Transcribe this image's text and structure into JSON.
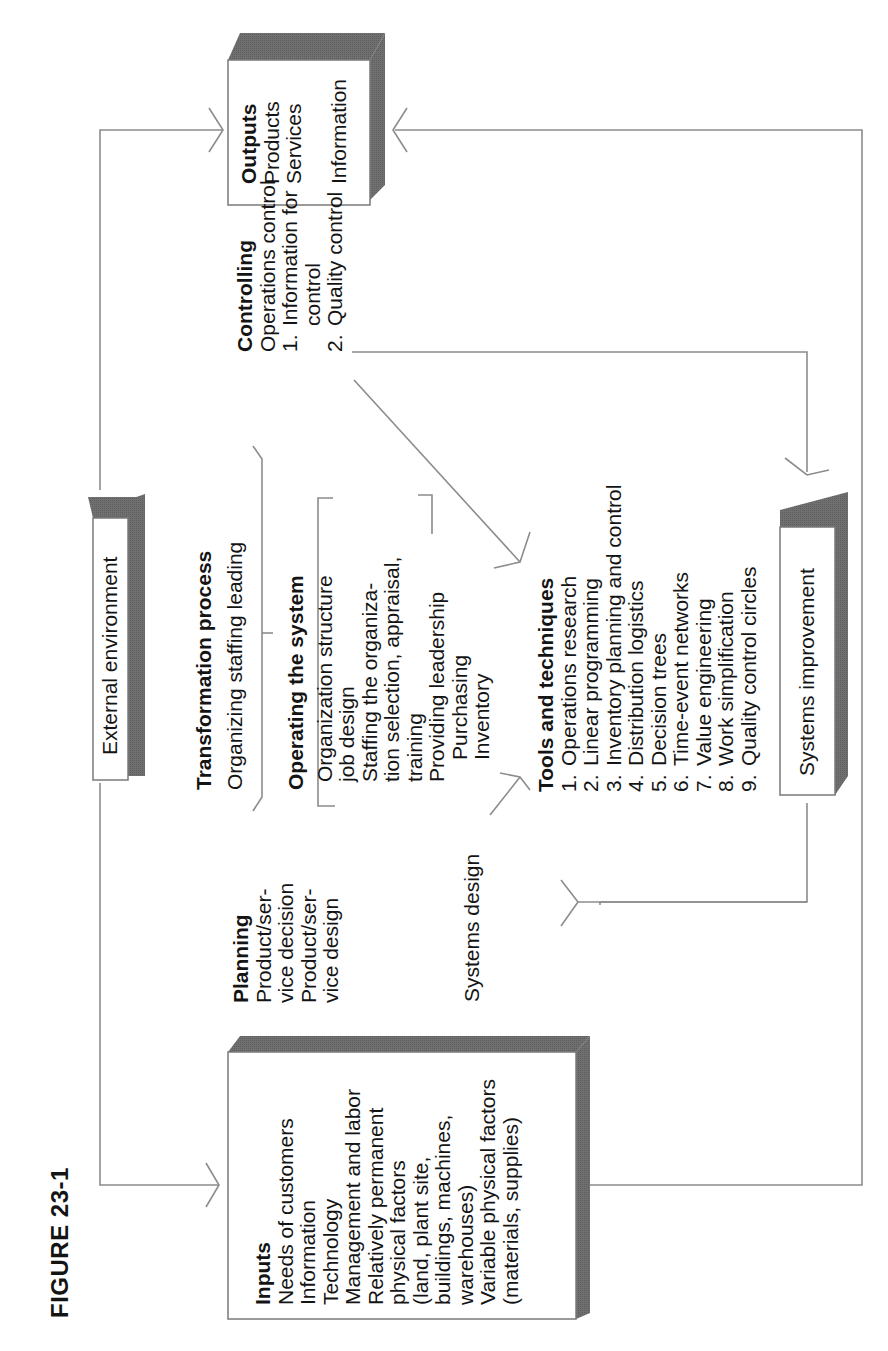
{
  "figure": {
    "label": "FIGURE 23-1"
  },
  "inputs": {
    "heading": "Inputs",
    "lines": [
      "Needs of customers",
      "Information",
      "Technology",
      "Management and labor",
      "Relatively permanent",
      "physical factors",
      "(land, plant site,",
      "buildings, machines,",
      "warehouses)",
      "Variable physical factors",
      "(materials, supplies)"
    ]
  },
  "outputs": {
    "heading": "Outputs",
    "lines": [
      "Products",
      "Services",
      "",
      "Information"
    ]
  },
  "external_environment": {
    "label": "External environment"
  },
  "systems_improvement": {
    "label": "Systems improvement"
  },
  "systems_design": {
    "label": "Systems design"
  },
  "planning": {
    "heading": "Planning",
    "lines": [
      "Product/ser-",
      "vice decision",
      "Product/ser-",
      "vice design"
    ]
  },
  "transformation": {
    "heading": "Transformation process",
    "subtitle": "Organizing staffing leading"
  },
  "operating": {
    "heading": "Operating the system",
    "lines": [
      "Organization structure",
      "job design",
      "Staffing the organiza-",
      "tion selection, appraisal,",
      "training",
      "Providing leadership",
      "Purchasing",
      "Inventory"
    ]
  },
  "controlling": {
    "heading": "Controlling",
    "lines": [
      {
        "num": "",
        "text": "Operations control",
        "indent": false
      },
      {
        "num": "1.",
        "text": "Information for",
        "indent": false
      },
      {
        "num": "",
        "text": "control",
        "indent": true
      },
      {
        "num": "2.",
        "text": "Quality control",
        "indent": false
      }
    ]
  },
  "tools": {
    "heading": "Tools and techniques",
    "items": [
      {
        "num": "1.",
        "text": "Operations research"
      },
      {
        "num": "2.",
        "text": "Linear programming"
      },
      {
        "num": "3.",
        "text": "Inventory planning and control"
      },
      {
        "num": "4.",
        "text": "Distribution logistics"
      },
      {
        "num": "5.",
        "text": "Decision trees"
      },
      {
        "num": "6.",
        "text": "Time-event networks"
      },
      {
        "num": "7.",
        "text": "Value engineering"
      },
      {
        "num": "8.",
        "text": "Work simplification"
      },
      {
        "num": "9.",
        "text": "Quality control circles"
      }
    ]
  },
  "colors": {
    "line": "#8a8a8a",
    "shadow": "#6e6e6e",
    "text": "#141414",
    "box_border": "#7a7a7a"
  }
}
